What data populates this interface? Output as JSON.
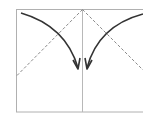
{
  "diagram": {
    "type": "origami-fold-instruction",
    "colors": {
      "paper_edge": "#b0b0b0",
      "crease": "#b8b8b8",
      "fold_line": "#8a8a8a",
      "arrow": "#333333",
      "background": "#ffffff"
    },
    "elements": [
      {
        "name": "paper-rectangle"
      },
      {
        "name": "center-crease"
      },
      {
        "name": "left-fold-line",
        "style": "dashed"
      },
      {
        "name": "right-fold-line",
        "style": "dashed"
      },
      {
        "name": "left-fold-arrow"
      },
      {
        "name": "right-fold-arrow"
      }
    ]
  }
}
